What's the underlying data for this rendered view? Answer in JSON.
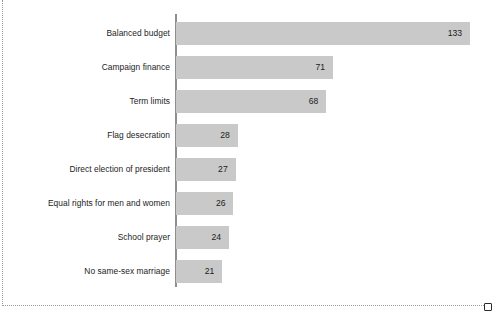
{
  "chart_data": {
    "type": "bar",
    "orientation": "horizontal",
    "title": "",
    "subtitle": "",
    "xlabel": "",
    "ylabel": "",
    "grid": false,
    "legend": false,
    "xlim": [
      0,
      140
    ],
    "axis_line": "vertical-left",
    "categories": [
      "Balanced budget",
      "Campaign finance",
      "Term limits",
      "Flag desecration",
      "Direct election of president",
      "Equal rights for men and women",
      "School prayer",
      "No same-sex marriage"
    ],
    "values": [
      133,
      71,
      68,
      28,
      27,
      26,
      24,
      21
    ],
    "value_labels": [
      "133",
      "71",
      "68",
      "28",
      "27",
      "26",
      "24",
      "21"
    ],
    "value_label_position": "inside-end",
    "bar_color": "#c9c9c9",
    "text_color": "#1c1c1c",
    "axis_color": "#8e8e8e",
    "background_color": "#ffffff"
  },
  "frame": {
    "border_style": "dotted",
    "border_color": "#9a9a9a",
    "handle_name": "resize-handle-bottom-right"
  }
}
